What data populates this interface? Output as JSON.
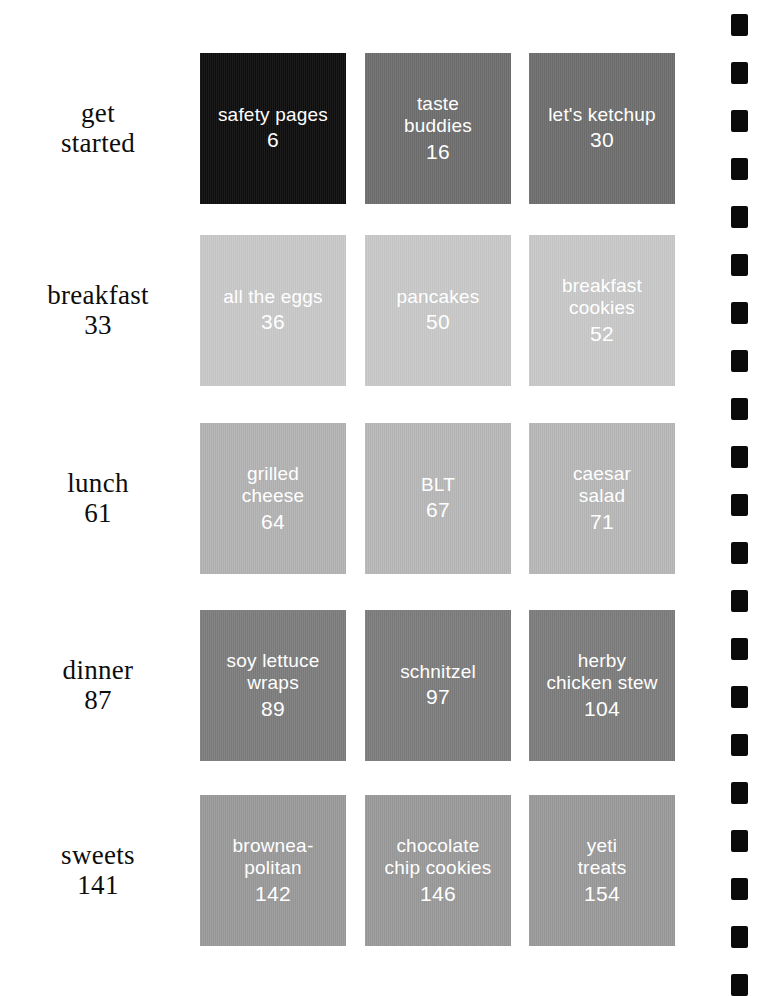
{
  "document": {
    "kind": "cookbook-table-of-contents",
    "background_color": "#ffffff",
    "label_text_color": "#0d0d0d",
    "tile_text_color": "#ffffff"
  },
  "sections": [
    {
      "name": "get\nstarted",
      "page": "",
      "tiles": [
        {
          "name": "safety pages",
          "page": "6",
          "color": "#0d0d0d"
        },
        {
          "name": "taste\nbuddies",
          "page": "16",
          "color": "#6e6e6e"
        },
        {
          "name": "let's ketchup",
          "page": "30",
          "color": "#6e6e6e"
        }
      ]
    },
    {
      "name": "breakfast",
      "page": "33",
      "tiles": [
        {
          "name": "all the eggs",
          "page": "36",
          "color": "#c9c9c9"
        },
        {
          "name": "pancakes",
          "page": "50",
          "color": "#c9c9c9"
        },
        {
          "name": "breakfast\ncookies",
          "page": "52",
          "color": "#c9c9c9"
        }
      ]
    },
    {
      "name": "lunch",
      "page": "61",
      "tiles": [
        {
          "name": "grilled\ncheese",
          "page": "64",
          "color": "#b3b3b3"
        },
        {
          "name": "BLT",
          "page": "67",
          "color": "#b8b8b8"
        },
        {
          "name": "caesar\nsalad",
          "page": "71",
          "color": "#b8b8b8"
        }
      ]
    },
    {
      "name": "dinner",
      "page": "87",
      "tiles": [
        {
          "name": "soy lettuce\nwraps",
          "page": "89",
          "color": "#7d7d7d"
        },
        {
          "name": "schnitzel",
          "page": "97",
          "color": "#7d7d7d"
        },
        {
          "name": "herby\nchicken stew",
          "page": "104",
          "color": "#7d7d7d"
        }
      ]
    },
    {
      "name": "sweets",
      "page": "141",
      "tiles": [
        {
          "name": "brownea-\npolitan",
          "page": "142",
          "color": "#9a9a9a"
        },
        {
          "name": "chocolate\nchip cookies",
          "page": "146",
          "color": "#9a9a9a"
        },
        {
          "name": "yeti\ntreats",
          "page": "154",
          "color": "#9a9a9a"
        }
      ]
    }
  ],
  "binding": {
    "mark_color": "#0a0a0a",
    "mark_count": 21,
    "first_mark_y": 14,
    "spacing": 48
  }
}
